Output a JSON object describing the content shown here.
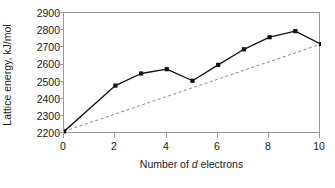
{
  "chart_data": {
    "type": "line",
    "title": "",
    "xlabel_prefix": "Number of ",
    "xlabel_italic": "d",
    "xlabel_suffix": " electrons",
    "xlabel": "Number of d electrons",
    "ylabel": "Lattice energy, kJ/mol",
    "xlim": [
      0,
      10
    ],
    "ylim": [
      2200,
      2900
    ],
    "xticks": [
      0,
      2,
      4,
      6,
      8,
      10
    ],
    "yticks": [
      2200,
      2300,
      2400,
      2500,
      2600,
      2700,
      2800,
      2900
    ],
    "xtick_labels": [
      "0",
      "2",
      "4",
      "6",
      "8",
      "10"
    ],
    "ytick_labels": [
      "2200",
      "2300",
      "2400",
      "2500",
      "2600",
      "2700",
      "2800",
      "2900"
    ],
    "grid": false,
    "legend": null,
    "legend_position": "none",
    "x": [
      0,
      1,
      2,
      3,
      4,
      5,
      6,
      7,
      8,
      9,
      10
    ],
    "series": [
      {
        "name": "Measured lattice energy",
        "style": "solid-with-square-markers",
        "color": "#111111",
        "marker": "square",
        "x": [
          0,
          2,
          3,
          4,
          5,
          6,
          7,
          8,
          9,
          10
        ],
        "values": [
          2215,
          2480,
          2550,
          2575,
          2508,
          2600,
          2690,
          2760,
          2795,
          2720
        ]
      },
      {
        "name": "Linear trend (no CFSE)",
        "style": "dashed",
        "color": "#8a8a8a",
        "marker": "none",
        "x": [
          0,
          10
        ],
        "values": [
          2215,
          2720
        ]
      }
    ]
  },
  "axes": {
    "frame_color": "#9a9a9a",
    "tick_color": "#9a9a9a"
  }
}
